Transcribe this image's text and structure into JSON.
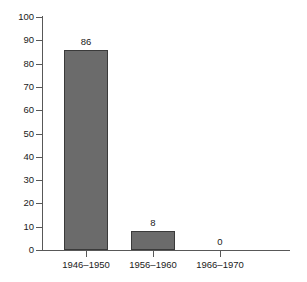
{
  "chart_data": {
    "type": "bar",
    "title": "",
    "xlabel": "",
    "ylabel": "",
    "categories": [
      "1946–1950",
      "1956–1960",
      "1966–1970"
    ],
    "values": [
      86,
      8,
      0
    ],
    "value_labels": [
      "86",
      "8",
      "0"
    ],
    "ylim": [
      0,
      100
    ],
    "ytick_labels": [
      "0",
      "10",
      "20",
      "30",
      "40",
      "50",
      "60",
      "70",
      "80",
      "90",
      "100"
    ],
    "ytick_values": [
      0,
      10,
      20,
      30,
      40,
      50,
      60,
      70,
      80,
      90,
      100
    ],
    "grid": false,
    "legend": null,
    "colors": {
      "bar_fill": "#6b6b6b",
      "bar_edge": "#3a3a3a",
      "axis": "#585858",
      "text": "#1a1a1a",
      "background": "#ffffff"
    }
  }
}
